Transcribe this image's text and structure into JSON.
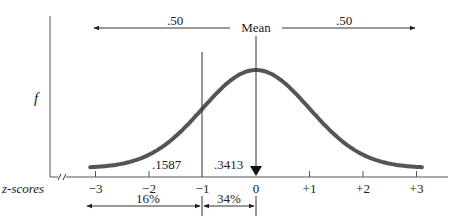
{
  "diagram": {
    "y_axis_label": "f",
    "x_axis_label": "z-scores",
    "mean_label": "Mean",
    "left_half_proportion": ".50",
    "right_half_proportion": ".50",
    "area_below_minus1": ".1587",
    "area_minus1_to_mean": ".3413",
    "percent_below_minus1": "16%",
    "percent_minus1_to_mean": "34%",
    "z_ticks": [
      {
        "value": -3,
        "label": "−3"
      },
      {
        "value": -2,
        "label": "−2"
      },
      {
        "value": -1,
        "label": "−1"
      },
      {
        "value": 0,
        "label": "0"
      },
      {
        "value": 1,
        "label": "+1"
      },
      {
        "value": 2,
        "label": "+2"
      },
      {
        "value": 3,
        "label": "+3"
      }
    ],
    "z_range": [
      -3.1,
      3.1
    ]
  }
}
